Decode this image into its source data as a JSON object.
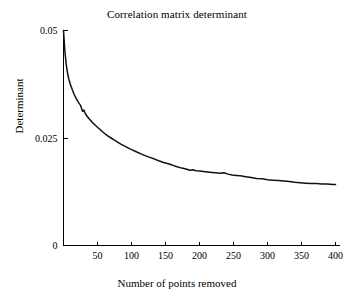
{
  "chart_data": {
    "type": "line",
    "title": "Correlation matrix determinant",
    "xlabel": "Number of points removed",
    "ylabel": "Determinant",
    "xlim": [
      0,
      400
    ],
    "ylim": [
      0,
      0.05
    ],
    "xticks": [
      0,
      50,
      100,
      150,
      200,
      250,
      300,
      350,
      400
    ],
    "xticklabels": [
      "",
      "50",
      "100",
      "150",
      "200",
      "250",
      "300",
      "350",
      "400"
    ],
    "yticks": [
      0,
      0.025,
      0.05
    ],
    "yticklabels": [
      "0",
      "0.025",
      "0.05"
    ],
    "grid": false,
    "legend": null,
    "series": [
      {
        "name": "determinant",
        "color": "#111111",
        "x": [
          0,
          2,
          4,
          6,
          8,
          10,
          13,
          16,
          19,
          22,
          25,
          28,
          30,
          32,
          35,
          38,
          42,
          46,
          50,
          55,
          60,
          65,
          70,
          75,
          80,
          85,
          90,
          95,
          100,
          107,
          114,
          120,
          127,
          134,
          140,
          147,
          154,
          160,
          167,
          174,
          180,
          186,
          190,
          195,
          200,
          206,
          212,
          218,
          224,
          230,
          236,
          242,
          248,
          254,
          260,
          268,
          276,
          284,
          292,
          300,
          308,
          316,
          324,
          332,
          340,
          348,
          356,
          364,
          372,
          380,
          388,
          396,
          400
        ],
        "y": [
          0.05,
          0.0452,
          0.0421,
          0.04,
          0.0386,
          0.0375,
          0.0362,
          0.035,
          0.0341,
          0.0333,
          0.0326,
          0.0312,
          0.0315,
          0.0307,
          0.03,
          0.0294,
          0.0287,
          0.0281,
          0.0275,
          0.0268,
          0.0261,
          0.0255,
          0.025,
          0.0245,
          0.024,
          0.0235,
          0.0231,
          0.0227,
          0.0223,
          0.0218,
          0.0213,
          0.0209,
          0.0205,
          0.0201,
          0.0197,
          0.0193,
          0.019,
          0.0187,
          0.0183,
          0.018,
          0.0178,
          0.0175,
          0.0176,
          0.0174,
          0.0173,
          0.0172,
          0.0171,
          0.017,
          0.0169,
          0.0168,
          0.0169,
          0.0166,
          0.0164,
          0.0163,
          0.0162,
          0.016,
          0.0158,
          0.0156,
          0.0155,
          0.0153,
          0.0152,
          0.0151,
          0.015,
          0.0149,
          0.0147,
          0.0146,
          0.0145,
          0.0144,
          0.0144,
          0.0143,
          0.0143,
          0.0142,
          0.0142
        ]
      }
    ]
  }
}
